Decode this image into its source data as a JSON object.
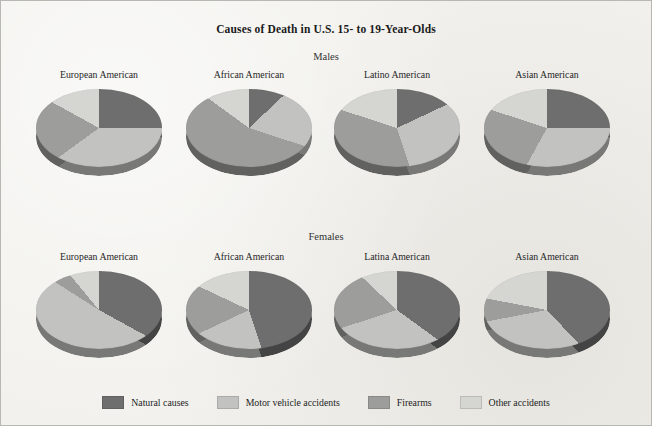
{
  "figure": {
    "title": "Causes of Death in U.S. 15- to 19-Year-Olds",
    "background_color": "#f2f1ed",
    "border_color": "#b9b7b1"
  },
  "groups": [
    {
      "label": "Males"
    },
    {
      "label": "Females"
    }
  ],
  "legend": {
    "position": "bottom",
    "items": [
      {
        "label": "Natural causes",
        "color": "#6e6e6e"
      },
      {
        "label": "Motor vehicle accidents",
        "color": "#c2c2c0"
      },
      {
        "label": "Firearms",
        "color": "#9d9d9b"
      },
      {
        "label": "Other accidents",
        "color": "#d5d5d2"
      }
    ]
  },
  "chart_data": {
    "type": "pie",
    "title": "Causes of Death in U.S. 15- to 19-Year-Olds",
    "xlabel": "",
    "ylabel": "",
    "units": "percent",
    "legend_position": "bottom",
    "series_names": [
      "Natural causes",
      "Motor vehicle accidents",
      "Firearms",
      "Other accidents"
    ],
    "series_colors": [
      "#6e6e6e",
      "#c2c2c0",
      "#9d9d9b",
      "#d5d5d2"
    ],
    "panels": [
      {
        "group": "Males",
        "category": "European American",
        "values": [
          25,
          40,
          18,
          17
        ]
      },
      {
        "group": "Males",
        "category": "African American",
        "values": [
          13,
          17,
          55,
          15
        ]
      },
      {
        "group": "Males",
        "category": "Latino American",
        "values": [
          18,
          27,
          35,
          20
        ]
      },
      {
        "group": "Males",
        "category": "Asian American",
        "values": [
          25,
          33,
          22,
          20
        ]
      },
      {
        "group": "Females",
        "category": "European American",
        "values": [
          33,
          51,
          5,
          11
        ]
      },
      {
        "group": "Females",
        "category": "African American",
        "values": [
          45,
          23,
          14,
          18
        ]
      },
      {
        "group": "Females",
        "category": "Latina American",
        "values": [
          35,
          35,
          17,
          13
        ]
      },
      {
        "group": "Females",
        "category": "Asian American",
        "values": [
          38,
          34,
          6,
          22
        ]
      }
    ]
  }
}
